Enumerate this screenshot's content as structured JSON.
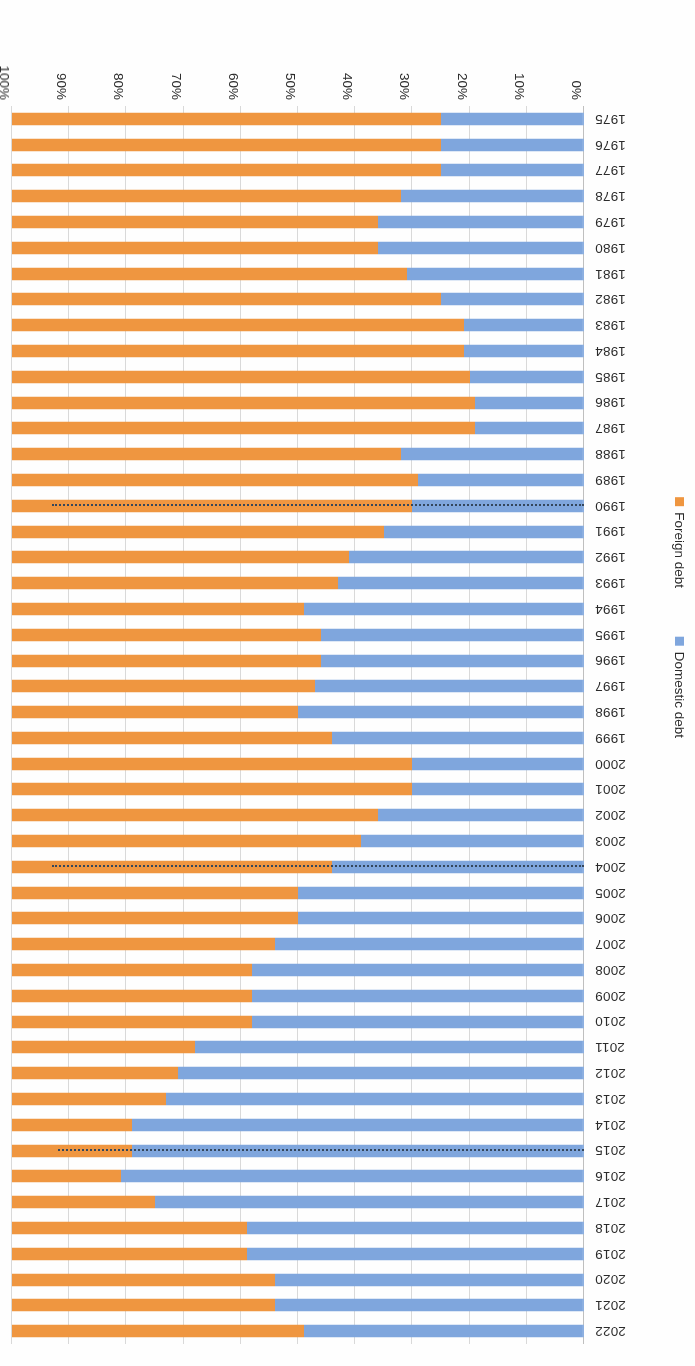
{
  "chart_data": {
    "type": "bar",
    "subtype": "100% stacked horizontal bar",
    "title": "",
    "xlabel": "",
    "ylabel": "",
    "xlim": [
      0,
      100
    ],
    "xticks": [
      "0%",
      "10%",
      "20%",
      "30%",
      "40%",
      "50%",
      "60%",
      "70%",
      "80%",
      "90%",
      "100%"
    ],
    "grid": true,
    "legend_position": "right",
    "colors": {
      "domestic": "#7fa6dd",
      "foreign": "#ef9640"
    },
    "categories": [
      "1975",
      "1976",
      "1977",
      "1978",
      "1979",
      "1980",
      "1981",
      "1982",
      "1983",
      "1984",
      "1985",
      "1986",
      "1987",
      "1988",
      "1989",
      "1990",
      "1991",
      "1992",
      "1993",
      "1994",
      "1995",
      "1996",
      "1997",
      "1998",
      "1999",
      "2000",
      "2001",
      "2002",
      "2003",
      "2004",
      "2005",
      "2006",
      "2007",
      "2008",
      "2009",
      "2010",
      "2011",
      "2012",
      "2013",
      "2014",
      "2015",
      "2016",
      "2017",
      "2018",
      "2019",
      "2020",
      "2021",
      "2022"
    ],
    "series": [
      {
        "name": "Domestic debt",
        "color": "#7fa6dd",
        "values": [
          25,
          25,
          25,
          32,
          36,
          36,
          31,
          25,
          21,
          21,
          20,
          19,
          19,
          32,
          29,
          30,
          35,
          41,
          43,
          49,
          46,
          46,
          47,
          50,
          44,
          30,
          30,
          36,
          39,
          44,
          50,
          50,
          54,
          58,
          58,
          58,
          68,
          71,
          73,
          79,
          79,
          81,
          75,
          59,
          59,
          54,
          54,
          49
        ]
      },
      {
        "name": "Foreign debt",
        "color": "#ef9640",
        "values": [
          75,
          75,
          75,
          68,
          64,
          64,
          69,
          75,
          79,
          79,
          80,
          81,
          81,
          68,
          71,
          70,
          65,
          59,
          57,
          51,
          54,
          54,
          53,
          50,
          56,
          70,
          70,
          64,
          61,
          56,
          50,
          50,
          46,
          42,
          42,
          42,
          32,
          29,
          27,
          21,
          21,
          19,
          25,
          41,
          41,
          46,
          46,
          51
        ]
      }
    ],
    "annotations": [
      {
        "name": "dotted-marker-1990",
        "year": "1990",
        "extent_pct": 93
      },
      {
        "name": "dotted-marker-2004",
        "year": "2004",
        "extent_pct": 93
      },
      {
        "name": "dotted-marker-2015",
        "year": "2015",
        "extent_pct": 92
      }
    ]
  },
  "legend": {
    "items": [
      {
        "label": "Domestic debt",
        "color": "#7fa6dd"
      },
      {
        "label": "Foreign debt",
        "color": "#ef9640"
      }
    ]
  }
}
